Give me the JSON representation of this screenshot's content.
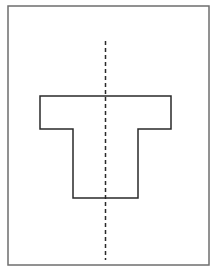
{
  "diagram": {
    "colors": {
      "background": "#ffffff",
      "frame": "#6e6e6e",
      "shape": "#2a2a2a",
      "axis": "#2a2a2a"
    },
    "frame": {
      "x": 8,
      "y": 6,
      "width": 201,
      "height": 259
    },
    "t_shape": {
      "points": "40,96 171,96 171,129 138,129 138,198 73,198 73,129 40,129"
    },
    "symmetry_line": {
      "x": 105.5,
      "y1": 41,
      "y2": 260,
      "dash": "4,3"
    }
  }
}
